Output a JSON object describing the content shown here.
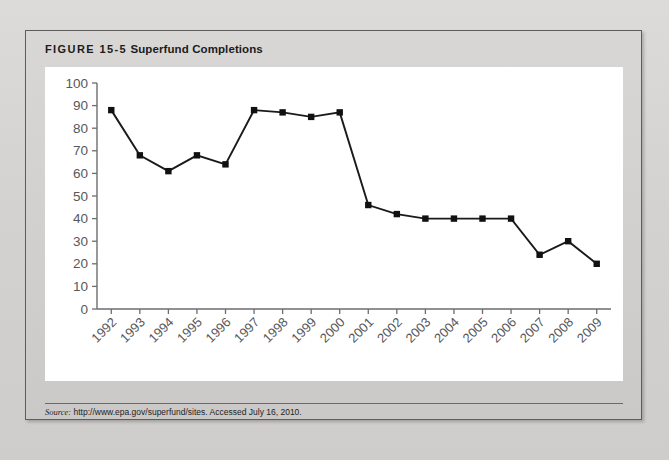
{
  "figure": {
    "label": "FIGURE 15-5",
    "caption": "Superfund Completions",
    "source_word": "Source:",
    "source_text": " http://www.epa.gov/superfund/sites. Accessed July 16, 2010."
  },
  "colors": {
    "page_background": "#d4d2d0",
    "panel_background": "#d1cfcd",
    "plot_background": "#ffffff",
    "border": "#5d5d5d",
    "line": "#1a1a1a",
    "marker": "#111111",
    "axis": "#6d6d6f",
    "tick_label": "#58585a"
  },
  "chart_data": {
    "type": "line",
    "title": "Superfund Completions",
    "xlabel": "",
    "ylabel": "",
    "ylim": [
      0,
      100
    ],
    "ytick_step": 10,
    "grid": false,
    "legend": false,
    "xtick_rotation": -45,
    "marker": "square",
    "categories": [
      "1992",
      "1993",
      "1994",
      "1995",
      "1996",
      "1997",
      "1998",
      "1999",
      "2000",
      "2001",
      "2002",
      "2003",
      "2004",
      "2005",
      "2006",
      "2007",
      "2008",
      "2009"
    ],
    "yticks": [
      "0",
      "10",
      "20",
      "30",
      "40",
      "50",
      "60",
      "70",
      "80",
      "90",
      "100"
    ],
    "values": [
      88,
      68,
      61,
      68,
      64,
      88,
      87,
      85,
      87,
      46,
      42,
      40,
      40,
      40,
      40,
      24,
      30,
      20
    ],
    "series": [
      {
        "name": "Superfund Completions",
        "values": [
          88,
          68,
          61,
          68,
          64,
          88,
          87,
          85,
          87,
          46,
          42,
          40,
          40,
          40,
          40,
          24,
          30,
          20
        ]
      }
    ]
  }
}
